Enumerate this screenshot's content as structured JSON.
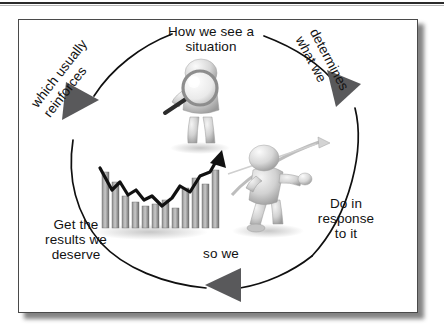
{
  "diagram": {
    "shape": "clockwise circular cycle with three arrowheads",
    "background_color": "#ffffff",
    "frame_border_color": "#4a4a4a",
    "arc_color": "#101010",
    "arrow_color": "#59595b",
    "text_color": "#121212",
    "labels": {
      "top": "How we see a\nsituation",
      "right_rotated": "determines\nwhat we",
      "right": "Do in\nresponse\nto it",
      "bottom": "so we",
      "bottom_left": "Get the\nresults we\ndeserve",
      "left_rotated": "which usually\nreinforces"
    },
    "arrowheads": [
      {
        "name": "arrowhead-left",
        "direction": "up-right"
      },
      {
        "name": "arrowhead-right",
        "direction": "down-right"
      },
      {
        "name": "arrowhead-bottom",
        "direction": "left"
      }
    ],
    "figures": [
      {
        "name": "magnifier-figure",
        "description": "3D gray human figure holding a large magnifying glass",
        "position": "top center"
      },
      {
        "name": "bar-chart-figure",
        "description": "3D gray bar chart with black rising trend arrow line",
        "position": "lower left"
      },
      {
        "name": "archer-figure",
        "description": "3D gray human figure drawing a bow and arrow",
        "position": "center right"
      }
    ]
  }
}
